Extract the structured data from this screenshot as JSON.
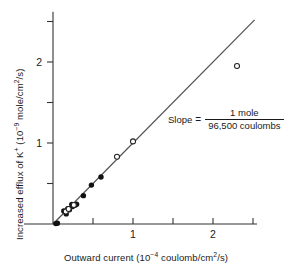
{
  "figure": {
    "background": "#ffffff",
    "line_color": "#555555",
    "marker_filled_color": "#111111",
    "marker_open_color": "#ffffff",
    "axis_color": "#333333"
  },
  "axes": {
    "x": {
      "title_main": "Outward current (10",
      "title_exp": "−4",
      "title_tail": " coulomb/cm",
      "title_exp2": "2",
      "title_end": "/s)",
      "ticks": [
        0,
        0.5,
        1,
        1.5,
        2,
        2.5
      ],
      "tick_labels": [
        "",
        "",
        "1",
        "",
        "2",
        ""
      ],
      "range": [
        0,
        2.55
      ]
    },
    "y": {
      "title_main": "Increased efflux of K",
      "title_charge": "+",
      "title_mid": " (10",
      "title_exp": "−9",
      "title_tail": " mole/cm",
      "title_exp2": "2",
      "title_end": "/s)",
      "ticks": [
        0,
        0.5,
        1,
        1.5,
        2,
        2.5
      ],
      "tick_labels": [
        "",
        "",
        "1",
        "",
        "2",
        ""
      ],
      "range": [
        0,
        2.62
      ]
    }
  },
  "annotation": {
    "slope_label": "Slope",
    "equals": "=",
    "numerator": "1 mole",
    "denominator": "96,500 coulombs"
  },
  "chart_data": {
    "type": "scatter",
    "title": "",
    "xlabel": "Outward current (10−4 coulomb/cm2/s)",
    "ylabel": "Increased efflux of K+ (10−9 mole/cm2/s)",
    "xlim": [
      0,
      2.55
    ],
    "ylim": [
      0,
      2.62
    ],
    "grid": false,
    "legend": "none",
    "series": [
      {
        "name": "filled-circles",
        "marker": "filled-circle",
        "points": [
          [
            0.035,
            0.005
          ],
          [
            0.055,
            0.01
          ],
          [
            0.135,
            0.16
          ],
          [
            0.165,
            0.125
          ],
          [
            0.185,
            0.19
          ],
          [
            0.205,
            0.175
          ],
          [
            0.235,
            0.24
          ],
          [
            0.245,
            0.215
          ],
          [
            0.275,
            0.23
          ],
          [
            0.295,
            0.245
          ],
          [
            0.38,
            0.35
          ],
          [
            0.48,
            0.48
          ],
          [
            0.6,
            0.58
          ]
        ]
      },
      {
        "name": "open-circles",
        "marker": "open-circle",
        "points": [
          [
            0.16,
            0.155
          ],
          [
            0.195,
            0.185
          ],
          [
            0.26,
            0.235
          ],
          [
            0.8,
            0.83
          ],
          [
            1.0,
            1.02
          ],
          [
            2.3,
            1.95
          ]
        ]
      }
    ],
    "fit_line": {
      "name": "slope-line",
      "through_origin": true,
      "slope": 1.0,
      "x_start": 0.0,
      "x_end": 2.52,
      "annotation": "Slope = 1 mole / 96,500 coulombs"
    }
  }
}
